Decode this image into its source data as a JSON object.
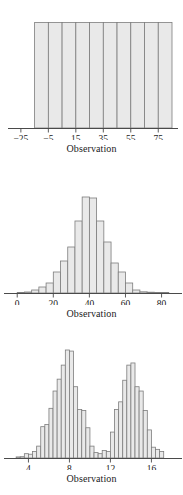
{
  "figure": {
    "background_color": "#ffffff",
    "bar_fill_color": "#e9e9e9",
    "bar_stroke_color": "#7d7d7d",
    "axis_color": "#4a4a4a"
  },
  "panels": [
    {
      "name": "uniform-histogram",
      "xlabel": "Observation",
      "ticks": [
        "-25",
        "-5",
        "15",
        "35",
        "55",
        "75"
      ]
    },
    {
      "name": "normal-histogram",
      "xlabel": "Observation",
      "ticks": [
        "0",
        "20",
        "40",
        "60",
        "80"
      ]
    },
    {
      "name": "bimodal-histogram",
      "xlabel": "Observation",
      "ticks": [
        "4",
        "8",
        "12",
        "16"
      ]
    }
  ],
  "chart_data": [
    {
      "type": "bar",
      "title": "",
      "subtitle": "",
      "xlabel": "Observation",
      "ylabel": "",
      "shape": "uniform",
      "grid": false,
      "legend": "none",
      "xlim": [
        -30,
        85
      ],
      "ylim": [
        0,
        1.1
      ],
      "tick_values": [
        -25,
        -5,
        15,
        35,
        55,
        75
      ],
      "tick_labels": [
        "-25",
        "-5",
        "15",
        "35",
        "55",
        "75"
      ],
      "bin_edges": [
        -15,
        -5,
        5,
        15,
        25,
        35,
        45,
        55,
        65,
        75,
        85
      ],
      "categories": [
        "-15 to -5",
        "-5 to 5",
        "5 to 15",
        "15 to 25",
        "25 to 35",
        "35 to 45",
        "45 to 55",
        "55 to 65",
        "65 to 75",
        "75 to 85"
      ],
      "values": [
        1,
        1,
        1,
        1,
        1,
        1,
        1,
        1,
        1,
        1
      ]
    },
    {
      "type": "bar",
      "title": "",
      "subtitle": "",
      "xlabel": "Observation",
      "ylabel": "",
      "shape": "normal",
      "grid": false,
      "legend": "none",
      "xlim": [
        -4,
        88
      ],
      "ylim": [
        0,
        1.0
      ],
      "tick_values": [
        0,
        20,
        40,
        60,
        80
      ],
      "tick_labels": [
        "0",
        "20",
        "40",
        "60",
        "80"
      ],
      "bin_edges": [
        0,
        4,
        8,
        12,
        16,
        20,
        24,
        28,
        32,
        36,
        40,
        44,
        48,
        52,
        56,
        60,
        64,
        68,
        72,
        76,
        80,
        84
      ],
      "categories": [
        "0-4",
        "4-8",
        "8-12",
        "12-16",
        "16-20",
        "20-24",
        "24-28",
        "28-32",
        "32-36",
        "36-40",
        "40-44",
        "44-48",
        "48-52",
        "52-56",
        "56-60",
        "60-64",
        "64-68",
        "68-72",
        "72-76",
        "76-80",
        "80-84"
      ],
      "values": [
        0.005,
        0.01,
        0.03,
        0.06,
        0.1,
        0.21,
        0.32,
        0.46,
        0.72,
        0.96,
        0.95,
        0.72,
        0.51,
        0.3,
        0.21,
        0.1,
        0.03,
        0.012,
        0.008,
        0.004,
        0.002
      ]
    },
    {
      "type": "bar",
      "title": "",
      "subtitle": "",
      "xlabel": "Observation",
      "ylabel": "",
      "shape": "bimodal",
      "grid": false,
      "legend": "none",
      "xlim": [
        2.2,
        18.4
      ],
      "ylim": [
        0,
        1.0
      ],
      "tick_values": [
        4,
        8,
        12,
        16
      ],
      "tick_labels": [
        "4",
        "8",
        "12",
        "16"
      ],
      "bin_edges": [
        2.8,
        3.2,
        3.6,
        4.0,
        4.4,
        4.8,
        5.2,
        5.6,
        6.0,
        6.4,
        6.8,
        7.2,
        7.6,
        8.0,
        8.4,
        8.8,
        9.2,
        9.6,
        10.0,
        10.4,
        10.8,
        11.2,
        11.6,
        12.0,
        12.4,
        12.8,
        13.2,
        13.6,
        14.0,
        14.4,
        14.8,
        15.2,
        15.6,
        16.0,
        16.4,
        16.8,
        17.2
      ],
      "categories": [
        "2.8",
        "3.2",
        "3.6",
        "4.0",
        "4.4",
        "4.8",
        "5.2",
        "5.6",
        "6.0",
        "6.4",
        "6.8",
        "7.2",
        "7.6",
        "8.0",
        "8.4",
        "8.8",
        "9.2",
        "9.6",
        "10.0",
        "10.4",
        "10.8",
        "11.2",
        "11.6",
        "12.0",
        "12.4",
        "12.8",
        "13.2",
        "13.6",
        "14.0",
        "14.4",
        "14.8",
        "15.2",
        "15.6",
        "16.0",
        "16.4",
        "16.8",
        "17.2"
      ],
      "values": [
        0.01,
        0.012,
        0.04,
        0.035,
        0.06,
        0.11,
        0.29,
        0.31,
        0.46,
        0.62,
        0.73,
        0.86,
        1.0,
        0.99,
        0.66,
        0.45,
        0.44,
        0.28,
        0.11,
        0.05,
        0.04,
        0.07,
        0.06,
        0.24,
        0.45,
        0.52,
        0.72,
        0.86,
        0.88,
        0.66,
        0.62,
        0.44,
        0.26,
        0.1,
        0.08,
        0.06,
        0.02
      ]
    }
  ]
}
